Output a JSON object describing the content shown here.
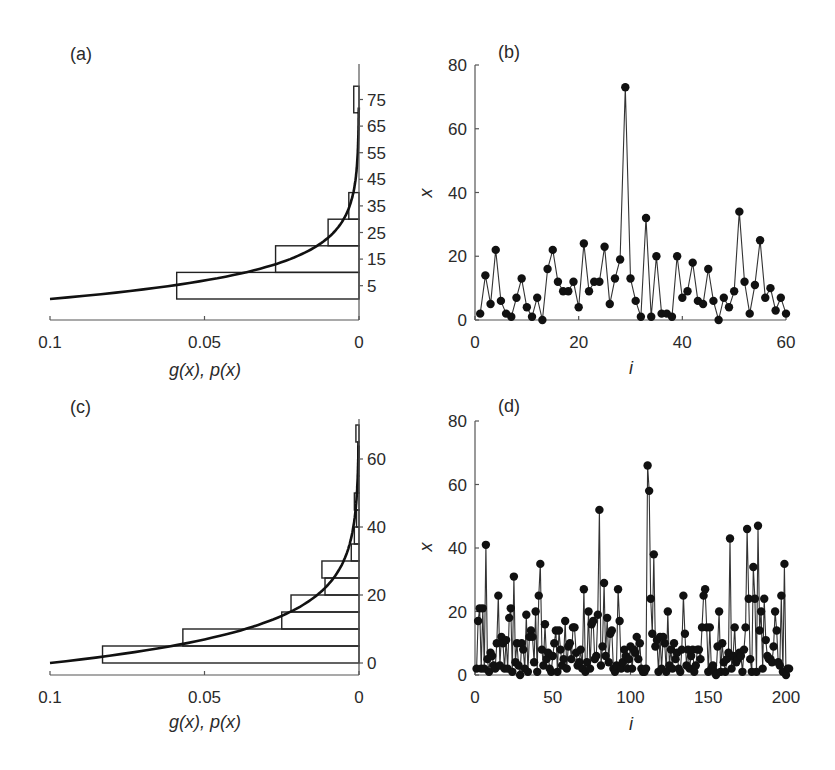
{
  "figure": {
    "panels": [
      "(a)",
      "(b)",
      "(c)",
      "(d)"
    ]
  },
  "chart_data": [
    {
      "id": "a",
      "panel_label": "(a)",
      "type": "bar",
      "orientation": "horizontal-histogram-with-density-curve",
      "xlabel": "g(x), p(x)",
      "ylabel": "",
      "x_ticks": [
        "0.1",
        "0.05",
        "0"
      ],
      "x_reversed": true,
      "xlim": [
        0.1,
        0
      ],
      "y_ticks": [
        "5",
        "15",
        "25",
        "35",
        "45",
        "55",
        "65",
        "75"
      ],
      "ylim": [
        -8,
        88
      ],
      "bin_width": 10,
      "bins": [
        {
          "from": 0,
          "to": 10,
          "value": 0.059
        },
        {
          "from": 10,
          "to": 20,
          "value": 0.027
        },
        {
          "from": 20,
          "to": 30,
          "value": 0.01
        },
        {
          "from": 30,
          "to": 40,
          "value": 0.0033
        },
        {
          "from": 40,
          "to": 50,
          "value": 0
        },
        {
          "from": 50,
          "to": 60,
          "value": 0
        },
        {
          "from": 60,
          "to": 70,
          "value": 0
        },
        {
          "from": 70,
          "to": 80,
          "value": 0.0017
        }
      ],
      "curve": "exponential-like density g(x) from (0.1, 0) decaying to 0 near x=75"
    },
    {
      "id": "b",
      "panel_label": "(b)",
      "type": "line",
      "markers": true,
      "xlabel": "i",
      "ylabel": "x",
      "x_ticks": [
        "0",
        "20",
        "40",
        "60"
      ],
      "y_ticks": [
        "0",
        "20",
        "40",
        "60",
        "80"
      ],
      "xlim": [
        0,
        60
      ],
      "ylim": [
        0,
        80
      ],
      "x": [
        1,
        2,
        3,
        4,
        5,
        6,
        7,
        8,
        9,
        10,
        11,
        12,
        13,
        14,
        15,
        16,
        17,
        18,
        19,
        20,
        21,
        22,
        23,
        24,
        25,
        26,
        27,
        28,
        29,
        30,
        31,
        32,
        33,
        34,
        35,
        36,
        37,
        38,
        39,
        40,
        41,
        42,
        43,
        44,
        45,
        46,
        47,
        48,
        49,
        50,
        51,
        52,
        53,
        54,
        55,
        56,
        57,
        58,
        59,
        60
      ],
      "values": [
        2,
        14,
        5,
        22,
        6,
        2,
        1,
        7,
        13,
        4,
        1,
        7,
        0,
        16,
        22,
        12,
        9,
        9,
        12,
        4,
        24,
        9,
        12,
        12,
        23,
        5,
        13,
        19,
        73,
        13,
        6,
        1,
        32,
        1,
        20,
        2,
        2,
        1,
        20,
        7,
        9,
        18,
        6,
        5,
        16,
        6,
        0,
        7,
        4,
        9,
        34,
        12,
        2,
        11,
        25,
        7,
        10,
        3,
        7,
        2
      ]
    },
    {
      "id": "c",
      "panel_label": "(c)",
      "type": "bar",
      "orientation": "horizontal-histogram-with-density-curve",
      "xlabel": "g(x), p(x)",
      "ylabel": "",
      "x_ticks": [
        "0.1",
        "0.05",
        "0"
      ],
      "x_reversed": true,
      "xlim": [
        0.1,
        0
      ],
      "y_ticks": [
        "0",
        "20",
        "40",
        "60"
      ],
      "ylim": [
        -3,
        72
      ],
      "bin_width": 5,
      "bins": [
        {
          "from": 0,
          "to": 5,
          "value": 0.083
        },
        {
          "from": 5,
          "to": 10,
          "value": 0.057
        },
        {
          "from": 10,
          "to": 15,
          "value": 0.025
        },
        {
          "from": 15,
          "to": 20,
          "value": 0.022
        },
        {
          "from": 20,
          "to": 25,
          "value": 0.011
        },
        {
          "from": 25,
          "to": 30,
          "value": 0.012
        },
        {
          "from": 30,
          "to": 35,
          "value": 0.0025
        },
        {
          "from": 35,
          "to": 40,
          "value": 0.0015
        },
        {
          "from": 40,
          "to": 45,
          "value": 0.0008
        },
        {
          "from": 45,
          "to": 50,
          "value": 0.0015
        },
        {
          "from": 50,
          "to": 55,
          "value": 0.0004
        },
        {
          "from": 55,
          "to": 60,
          "value": 0.0004
        },
        {
          "from": 60,
          "to": 65,
          "value": 0.0004
        },
        {
          "from": 65,
          "to": 70,
          "value": 0.001
        }
      ],
      "curve": "exponential-like density g(x) from (0.1, 0) decaying to 0 near x=65"
    },
    {
      "id": "d",
      "panel_label": "(d)",
      "type": "line",
      "markers": true,
      "xlabel": "i",
      "ylabel": "x",
      "x_ticks": [
        "0",
        "50",
        "100",
        "150",
        "200"
      ],
      "y_ticks": [
        "0",
        "20",
        "40",
        "60",
        "80"
      ],
      "xlim": [
        0,
        200
      ],
      "ylim": [
        0,
        80
      ],
      "values": [
        2,
        17,
        21,
        2,
        21,
        2,
        41,
        5,
        1,
        7,
        6,
        3,
        2,
        10,
        25,
        3,
        12,
        10,
        2,
        11,
        2,
        18,
        21,
        1,
        31,
        4,
        10,
        3,
        0,
        10,
        8,
        2,
        19,
        1,
        12,
        14,
        12,
        4,
        20,
        1,
        25,
        35,
        8,
        3,
        16,
        5,
        7,
        2,
        1,
        6,
        10,
        14,
        1,
        14,
        8,
        3,
        5,
        17,
        2,
        9,
        10,
        5,
        15,
        15,
        7,
        3,
        4,
        8,
        2,
        27,
        1,
        4,
        20,
        2,
        16,
        17,
        5,
        6,
        19,
        52,
        3,
        9,
        29,
        6,
        18,
        4,
        13,
        14,
        2,
        1,
        3,
        27,
        17,
        2,
        4,
        8,
        6,
        2,
        5,
        9,
        2,
        8,
        7,
        12,
        5,
        10,
        2,
        1,
        1,
        2,
        66,
        58,
        24,
        13,
        38,
        9,
        11,
        1,
        12,
        2,
        12,
        10,
        1,
        20,
        3,
        8,
        2,
        10,
        5,
        7,
        2,
        1,
        8,
        25,
        13,
        3,
        8,
        2,
        6,
        8,
        1,
        3,
        8,
        8,
        5,
        15,
        25,
        27,
        15,
        1,
        15,
        2,
        3,
        1,
        0,
        9,
        20,
        1,
        10,
        4,
        1,
        5,
        7,
        43,
        2,
        6,
        15,
        4,
        5,
        7,
        6,
        1,
        8,
        15,
        46,
        24,
        5,
        1,
        34,
        24,
        1,
        47,
        14,
        20,
        2,
        24,
        11,
        6,
        5,
        5,
        4,
        9,
        20,
        14,
        4,
        3,
        25,
        1,
        35,
        0,
        2,
        2
      ]
    }
  ]
}
